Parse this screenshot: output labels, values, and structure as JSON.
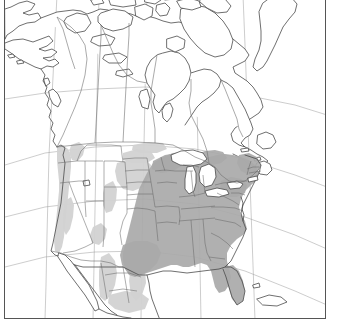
{
  "figure": {
    "kind": "distribution-range-map",
    "region": "North America",
    "frame": {
      "visible": true,
      "color": "#555555"
    },
    "background_color": "#ffffff"
  },
  "map": {
    "title": "",
    "projection_hint": "conic",
    "graticule_visible": true,
    "labels": [],
    "legend": {
      "visible": false,
      "entries": []
    },
    "shading": {
      "core_range": {
        "color": "#a9a9a9",
        "label": ""
      },
      "peripheral_range": {
        "color": "#d2d2d2",
        "label": ""
      },
      "no_range": {
        "color": "#ffffff",
        "label": ""
      }
    },
    "features": {
      "landmasses": [
        "Alaska",
        "Canada mainland",
        "Canadian Arctic Archipelago",
        "Greenland coast",
        "Contiguous United States",
        "Mexico",
        "Baja California",
        "Newfoundland",
        "Nova Scotia",
        "Vancouver Island",
        "Florida peninsula",
        "Cuba"
      ],
      "water_bodies": [
        "Hudson Bay",
        "Great Lakes",
        "Gulf of Mexico",
        "Pacific Ocean",
        "Atlantic Ocean",
        "Great Salt Lake"
      ],
      "boundaries": [
        "Canada-United States border",
        "United States-Mexico border",
        "US state boundaries",
        "Canadian province boundaries"
      ]
    }
  }
}
